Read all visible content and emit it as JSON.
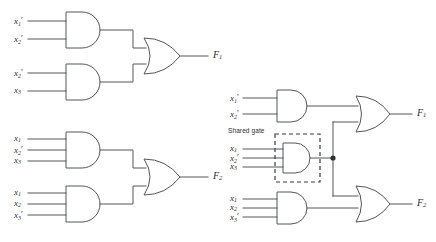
{
  "figure": {
    "background": "#ffffff",
    "wire_color": "#55565a",
    "text_color": "#2b2c2e"
  },
  "circuits": [
    {
      "id": "left-f1",
      "output_label": "F",
      "output_sub": "1",
      "and_gates": [
        {
          "id": "left-f1-and-top",
          "inputs": [
            {
              "var": "x",
              "sub": "1",
              "prime": true
            },
            {
              "var": "x",
              "sub": "2",
              "prime": true
            }
          ]
        },
        {
          "id": "left-f1-and-bottom",
          "inputs": [
            {
              "var": "x",
              "sub": "2",
              "prime": true
            },
            {
              "var": "x",
              "sub": "3",
              "prime": false
            }
          ]
        }
      ],
      "or_gate": {
        "id": "left-f1-or",
        "inputs": 2
      }
    },
    {
      "id": "left-f2",
      "output_label": "F",
      "output_sub": "2",
      "and_gates": [
        {
          "id": "left-f2-and-top",
          "inputs": [
            {
              "var": "x",
              "sub": "1",
              "prime": false
            },
            {
              "var": "x",
              "sub": "2",
              "prime": true
            },
            {
              "var": "x",
              "sub": "3",
              "prime": false
            }
          ]
        },
        {
          "id": "left-f2-and-bottom",
          "inputs": [
            {
              "var": "x",
              "sub": "1",
              "prime": false
            },
            {
              "var": "x",
              "sub": "2",
              "prime": false
            },
            {
              "var": "x",
              "sub": "3",
              "prime": true
            }
          ]
        }
      ],
      "or_gate": {
        "id": "left-f2-or",
        "inputs": 2
      }
    },
    {
      "id": "right-shared",
      "shared_gate_label": "Shared gate",
      "outputs": [
        {
          "label": "F",
          "sub": "1"
        },
        {
          "label": "F",
          "sub": "2"
        }
      ],
      "and_gates": [
        {
          "id": "right-and-top",
          "inputs": [
            {
              "var": "x",
              "sub": "1",
              "prime": true
            },
            {
              "var": "x",
              "sub": "2",
              "prime": true
            }
          ]
        },
        {
          "id": "right-and-shared",
          "shared": true,
          "inputs": [
            {
              "var": "x",
              "sub": "1",
              "prime": false
            },
            {
              "var": "x",
              "sub": "2",
              "prime": true
            },
            {
              "var": "x",
              "sub": "3",
              "prime": false
            }
          ]
        },
        {
          "id": "right-and-bottom",
          "inputs": [
            {
              "var": "x",
              "sub": "1",
              "prime": false
            },
            {
              "var": "x",
              "sub": "2",
              "prime": false
            },
            {
              "var": "x",
              "sub": "3",
              "prime": true
            }
          ]
        }
      ],
      "or_gates": [
        {
          "id": "right-or-top",
          "inputs": 2
        },
        {
          "id": "right-or-bottom",
          "inputs": 2
        }
      ]
    }
  ],
  "labels": {
    "left_f1_in1": "x",
    "left_f1_in1_sub": "1",
    "left_f1_in2": "x",
    "left_f1_in2_sub": "2",
    "left_f1_in3": "x",
    "left_f1_in3_sub": "2",
    "left_f1_in4": "x",
    "left_f1_in4_sub": "3",
    "left_f1_out": "F",
    "left_f1_out_sub": "1",
    "left_f2_in1": "x",
    "left_f2_in1_sub": "1",
    "left_f2_in2": "x",
    "left_f2_in2_sub": "2",
    "left_f2_in3": "x",
    "left_f2_in3_sub": "3",
    "left_f2_in4": "x",
    "left_f2_in4_sub": "1",
    "left_f2_in5": "x",
    "left_f2_in5_sub": "2",
    "left_f2_in6": "x",
    "left_f2_in6_sub": "3",
    "left_f2_out": "F",
    "left_f2_out_sub": "2",
    "right_in1": "x",
    "right_in1_sub": "1",
    "right_in2": "x",
    "right_in2_sub": "2",
    "right_sh1": "x",
    "right_sh1_sub": "1",
    "right_sh2": "x",
    "right_sh2_sub": "2",
    "right_sh3": "x",
    "right_sh3_sub": "3",
    "right_bot1": "x",
    "right_bot1_sub": "1",
    "right_bot2": "x",
    "right_bot2_sub": "2",
    "right_bot3": "x",
    "right_bot3_sub": "3",
    "right_out1": "F",
    "right_out1_sub": "1",
    "right_out2": "F",
    "right_out2_sub": "2",
    "shared_gate": "Shared gate",
    "prime": "′"
  }
}
